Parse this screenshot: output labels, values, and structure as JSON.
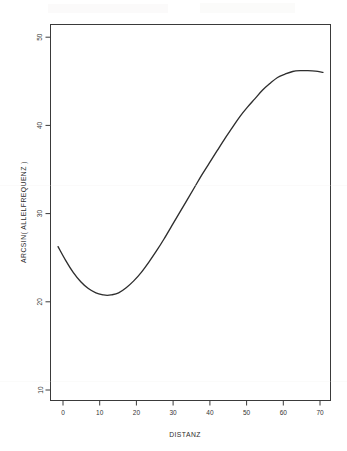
{
  "chart_data": {
    "type": "line",
    "title": "",
    "subtitle": "",
    "xlabel": "DISTANZ",
    "ylabel": "ARCSIN( ALLELFREQUENZ )",
    "xlim": [
      -2,
      72
    ],
    "ylim": [
      8,
      52
    ],
    "xticks": [
      0,
      10,
      20,
      30,
      40,
      50,
      60,
      70
    ],
    "yticks": [
      10,
      20,
      30,
      40,
      50
    ],
    "xtick_labels": [
      "0",
      "10",
      "20",
      "30",
      "40",
      "50",
      "60",
      "70"
    ],
    "ytick_labels": [
      "10",
      "20",
      "30",
      "40",
      "50"
    ],
    "grid": false,
    "legend": null,
    "legend_position": "none",
    "annotations": [],
    "series": [
      {
        "name": "fitted-curve",
        "color": "#2e2e2e",
        "x": [
          0,
          2,
          4,
          6,
          8,
          10,
          12,
          13,
          14,
          16,
          18,
          20,
          22,
          24,
          26,
          28,
          30,
          32,
          34,
          36,
          38,
          40,
          42,
          44,
          46,
          48,
          50,
          52,
          54,
          56,
          58,
          60,
          62,
          64,
          66,
          68,
          70
        ],
        "y": [
          26.0,
          24.4,
          23.0,
          21.9,
          21.1,
          20.6,
          20.35,
          20.3,
          20.35,
          20.6,
          21.2,
          22.0,
          23.0,
          24.2,
          25.5,
          26.9,
          28.4,
          29.9,
          31.4,
          32.9,
          34.4,
          35.8,
          37.2,
          38.6,
          39.9,
          41.2,
          42.3,
          43.3,
          44.3,
          45.1,
          45.8,
          46.2,
          46.5,
          46.6,
          46.6,
          46.55,
          46.4
        ]
      }
    ],
    "key_points": {
      "start": {
        "x": 0,
        "y": 26.0
      },
      "minimum": {
        "x": 13,
        "y": 20.3
      },
      "maximum": {
        "x": 66,
        "y": 46.6
      },
      "end": {
        "x": 70,
        "y": 46.4
      }
    }
  },
  "figure": {
    "background_color": "#ffffff",
    "line_color": "#2e2e2e",
    "axis_color": "#3a3a3a"
  }
}
